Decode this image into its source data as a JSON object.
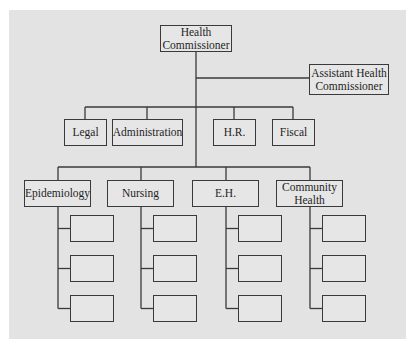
{
  "nodes": {
    "head": {
      "label": "Health Commissioner"
    },
    "assistant": {
      "label": "Assistant Health Commissioner"
    },
    "support": [
      {
        "label": "Legal"
      },
      {
        "label": "Administration"
      },
      {
        "label": "H.R."
      },
      {
        "label": "Fiscal"
      }
    ],
    "divisions": [
      {
        "label": "Epidemiology",
        "sub_units": [
          "",
          "",
          ""
        ]
      },
      {
        "label": "Nursing",
        "sub_units": [
          "",
          "",
          ""
        ]
      },
      {
        "label": "E.H.",
        "sub_units": [
          "",
          "",
          ""
        ]
      },
      {
        "label": "Community Health",
        "sub_units": [
          "",
          "",
          ""
        ]
      }
    ]
  },
  "colors": {
    "background": "#e3e3e3",
    "line": "#3a3a3a"
  }
}
